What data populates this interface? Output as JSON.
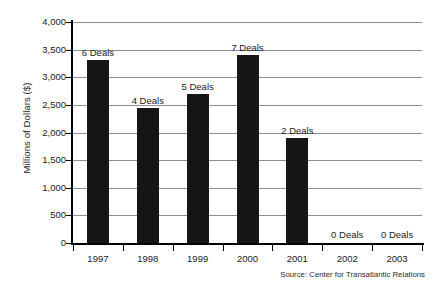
{
  "chart_data": {
    "type": "bar",
    "title": "",
    "xlabel": "",
    "ylabel": "Millions of Dollars ($)",
    "categories": [
      "1997",
      "1998",
      "1999",
      "2000",
      "2001",
      "2002",
      "2003"
    ],
    "values": [
      3320,
      2450,
      2700,
      3400,
      1900,
      0,
      0
    ],
    "point_labels": [
      "6 Deals",
      "4 Deals",
      "5 Deals",
      "7 Deals",
      "2 Deals",
      "0 Deals",
      "0 Deals"
    ],
    "deal_counts": [
      6,
      4,
      5,
      7,
      2,
      0,
      0
    ],
    "ylim": [
      0,
      4000
    ],
    "ytick_values": [
      0,
      500,
      1000,
      1500,
      2000,
      2500,
      3000,
      3500,
      4000
    ],
    "ytick_labels": [
      "0",
      "500",
      "1,000",
      "1,500",
      "2,000",
      "2,500",
      "3,000",
      "3,500",
      "4,000"
    ],
    "grid": true,
    "legend": "none",
    "bar_color": "#161616",
    "grid_color": "#8f8f8f",
    "axis_color": "#000000",
    "source": "Source: Center for Transatlantic Relations"
  }
}
